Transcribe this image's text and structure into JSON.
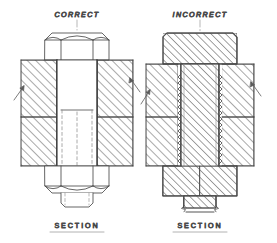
{
  "figure": {
    "kind": "engineering-drawing",
    "stroke_color": "#4a4a4a",
    "hatch_color": "#5a5a5a",
    "text_color": "#6d6d6d",
    "background": "#ffffff"
  },
  "panels": [
    {
      "id": "correct",
      "caption": "CORRECT",
      "section_label": "SECTION",
      "description": "Bolt head, shank and nut left unsectioned; only the plates are hatched.",
      "center_x": 77,
      "parts": [
        {
          "name": "hex-bolt-head",
          "hatched": false
        },
        {
          "name": "bolt-shank",
          "hatched": false
        },
        {
          "name": "hex-nut",
          "hatched": false
        },
        {
          "name": "upper-plate",
          "hatched": true
        },
        {
          "name": "lower-plate",
          "hatched": true
        }
      ]
    },
    {
      "id": "incorrect",
      "caption": "INCORRECT",
      "section_label": "SECTION",
      "description": "Bolt head, threaded shank and nut wrongly cross-hatched along with the plates.",
      "center_x": 200,
      "parts": [
        {
          "name": "bolt-head",
          "hatched": true
        },
        {
          "name": "threaded-shank",
          "hatched": true
        },
        {
          "name": "nut",
          "hatched": true
        },
        {
          "name": "upper-plate",
          "hatched": true
        },
        {
          "name": "lower-plate",
          "hatched": true
        }
      ]
    }
  ]
}
